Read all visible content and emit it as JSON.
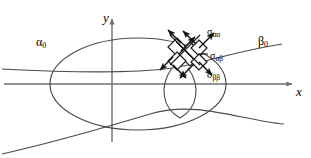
{
  "figure": {
    "type": "geometric-diagram",
    "background_color": "#ffffff",
    "axis_color": "#6e6e6e",
    "curve_color": "#4a4a4a",
    "arrow_color": "#1a1a1a",
    "axes": {
      "x_label": "x",
      "y_label": "y",
      "origin": {
        "x": 112,
        "y": 84
      },
      "x_axis_start": 4,
      "x_axis_end": 295,
      "y_axis_top": 16,
      "y_axis_bottom": 142
    },
    "curves": [
      {
        "name": "alpha-zero-curve",
        "label": "α",
        "label_subscript": "0",
        "label_full": "α₀",
        "shape": "ellipse",
        "center_x": 138,
        "center_y": 84,
        "radius_x": 88,
        "radius_y": 46
      },
      {
        "name": "beta-zero-curve",
        "label": "β",
        "label_subscript": "0",
        "label_full": "β₀",
        "shape": "hyperbola-branch-pair"
      },
      {
        "name": "small-loop-curve",
        "shape": "teardrop-loop"
      }
    ],
    "stress_labels": [
      {
        "name": "sigma-alpha-alpha",
        "symbol": "σ",
        "subscript": "αα",
        "full": "σαα",
        "position": {
          "x": 207,
          "y": 27
        }
      },
      {
        "name": "sigma-alpha-beta",
        "symbol": "σ",
        "subscript": "αβ",
        "full": "σαβ",
        "position": {
          "x": 210,
          "y": 51
        }
      },
      {
        "name": "sigma-beta-beta",
        "symbol": "σ",
        "subscript": "ββ",
        "full": "σββ",
        "position": {
          "x": 207,
          "y": 70
        }
      }
    ],
    "arrow_cluster": {
      "name": "stress-arrow-cluster",
      "center": {
        "x": 190,
        "y": 53
      },
      "arrow_count": 8,
      "central_shape": "diamond"
    }
  }
}
